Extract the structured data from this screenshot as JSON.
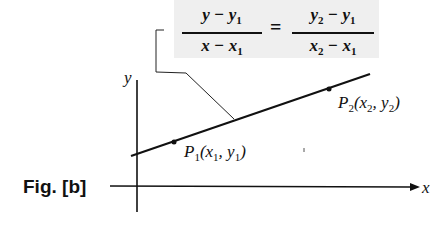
{
  "figure": {
    "label": "Fig. [b]",
    "formula": {
      "left_numerator": "y − y",
      "left_numerator_sub": "1",
      "left_denominator": "x − x",
      "left_denominator_sub": "1",
      "equals": "=",
      "right_numerator_a": "y",
      "right_numerator_a_sub": "2",
      "right_numerator_b": " − y",
      "right_numerator_b_sub": "1",
      "right_denominator_a": "x",
      "right_denominator_a_sub": "2",
      "right_denominator_b": " − x",
      "right_denominator_b_sub": "1"
    },
    "axes": {
      "x_label": "x",
      "y_label": "y"
    },
    "points": {
      "p1": {
        "name": "P",
        "name_sub": "1",
        "coords_open": "(x",
        "c1_sub": "1",
        "mid": ", y",
        "c2_sub": "1",
        "close": ")"
      },
      "p2": {
        "name": "P",
        "name_sub": "2",
        "coords_open": "(x",
        "c1_sub": "2",
        "mid": ", y",
        "c2_sub": "2",
        "close": ")"
      }
    }
  }
}
